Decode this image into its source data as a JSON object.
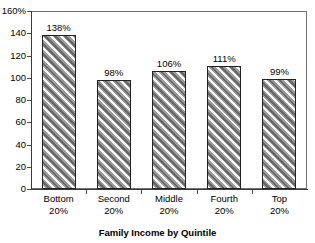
{
  "chart_data": {
    "type": "bar",
    "title": "",
    "title_remnant": "",
    "xlabel": "Family Income by Quintile",
    "ylabel": "",
    "categories": [
      "Bottom 20%",
      "Second 20%",
      "Middle 20%",
      "Fourth 20%",
      "Top 20%"
    ],
    "category_lines": [
      [
        "Bottom",
        "20%"
      ],
      [
        "Second",
        "20%"
      ],
      [
        "Middle",
        "20%"
      ],
      [
        "Fourth",
        "20%"
      ],
      [
        "Top",
        "20%"
      ]
    ],
    "values": [
      138,
      98,
      106,
      111,
      99
    ],
    "data_labels": [
      "138%",
      "98%",
      "106%",
      "111%",
      "99%"
    ],
    "ylim": [
      0,
      160
    ],
    "ytick_values": [
      0,
      20,
      40,
      60,
      80,
      100,
      120,
      140,
      160
    ],
    "ytick_labels": [
      "0",
      "20",
      "40",
      "60",
      "80",
      "100",
      "120",
      "140",
      "160%"
    ],
    "grid": false,
    "legend": null,
    "bar_fill_color": "#9a9a9a",
    "bar_edge_color": "#222222",
    "bar_hatch": "diagonal-stripes",
    "axis_color": "#3a3a3a",
    "background_color": "#ffffff"
  }
}
